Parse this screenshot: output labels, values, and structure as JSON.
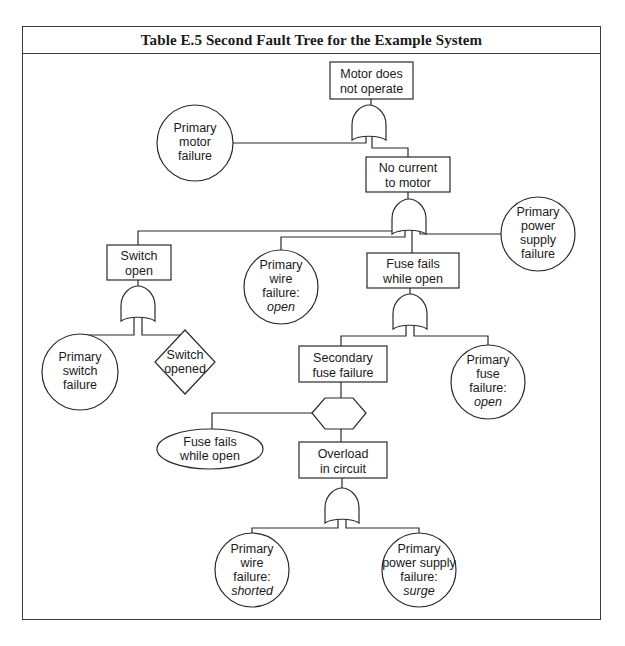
{
  "title": "Table E.5   Second Fault Tree for the Example System",
  "nodes": {
    "top": {
      "type": "event-box",
      "lines": [
        "Motor does",
        "not operate"
      ]
    },
    "primary_motor": {
      "type": "basic-event-circle",
      "lines": [
        "Primary",
        "motor",
        "failure"
      ]
    },
    "no_current": {
      "type": "event-box",
      "lines": [
        "No current",
        "to motor"
      ]
    },
    "switch_open": {
      "type": "event-box",
      "lines": [
        "Switch",
        "open"
      ]
    },
    "primary_wire_open": {
      "type": "basic-event-circle",
      "lines": [
        "Primary",
        "wire",
        "failure:"
      ],
      "italic": "open"
    },
    "fuse_fails": {
      "type": "event-box",
      "lines": [
        "Fuse fails",
        "while open"
      ]
    },
    "primary_power": {
      "type": "basic-event-circle",
      "lines": [
        "Primary",
        "power",
        "supply",
        "failure"
      ]
    },
    "primary_switch": {
      "type": "basic-event-circle",
      "lines": [
        "Primary",
        "switch",
        "failure"
      ]
    },
    "switch_opened": {
      "type": "undeveloped-diamond",
      "lines": [
        "Switch",
        "opened"
      ]
    },
    "secondary_fuse": {
      "type": "event-box",
      "lines": [
        "Secondary",
        "fuse failure"
      ]
    },
    "primary_fuse_open": {
      "type": "basic-event-circle",
      "lines": [
        "Primary",
        "fuse",
        "failure:"
      ],
      "italic": "open"
    },
    "condition": {
      "type": "inhibit-hexagon",
      "lines": []
    },
    "fuse_fails_cond": {
      "type": "conditioning-ellipse",
      "lines": [
        "Fuse fails",
        "while open"
      ]
    },
    "overload": {
      "type": "event-box",
      "lines": [
        "Overload",
        "in circuit"
      ]
    },
    "primary_wire_shorted": {
      "type": "basic-event-circle",
      "lines": [
        "Primary",
        "wire",
        "failure:"
      ],
      "italic": "shorted"
    },
    "primary_power_surge": {
      "type": "basic-event-circle",
      "lines": [
        "Primary",
        "power supply",
        "failure:"
      ],
      "italic": "surge"
    }
  },
  "gates": [
    {
      "id": "or-gate-top",
      "type": "OR",
      "output": "Motor does not operate",
      "inputs": [
        "Primary motor failure",
        "No current to motor"
      ]
    },
    {
      "id": "or-gate-no-current",
      "type": "OR",
      "output": "No current to motor",
      "inputs": [
        "Switch open",
        "Primary wire failure: open",
        "Fuse fails while open",
        "Primary power supply failure"
      ]
    },
    {
      "id": "or-gate-switch",
      "type": "OR",
      "output": "Switch open",
      "inputs": [
        "Primary switch failure",
        "Switch opened"
      ]
    },
    {
      "id": "or-gate-fuse",
      "type": "OR",
      "output": "Fuse fails while open",
      "inputs": [
        "Secondary fuse failure",
        "Primary fuse failure: open"
      ]
    },
    {
      "id": "inhibit-gate",
      "type": "INHIBIT",
      "output": "Secondary fuse failure",
      "inputs": [
        "Overload in circuit"
      ],
      "condition": "Fuse fails while open"
    },
    {
      "id": "or-gate-overload",
      "type": "OR",
      "output": "Overload in circuit",
      "inputs": [
        "Primary wire failure: shorted",
        "Primary power supply failure: surge"
      ]
    }
  ]
}
